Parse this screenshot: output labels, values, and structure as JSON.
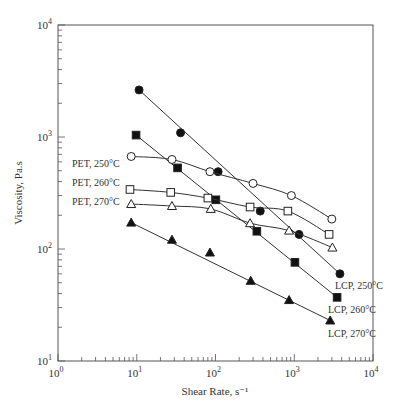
{
  "chart_data": {
    "type": "line",
    "title": "",
    "xlabel": "Shear Rate, s⁻¹",
    "ylabel": "Viscosity, Pa.s",
    "xscale": "log",
    "yscale": "log",
    "xlim": [
      1,
      10000
    ],
    "ylim": [
      10,
      10000
    ],
    "grid": false,
    "x_ticks": [
      {
        "base": "10",
        "exp": "0",
        "value": 1
      },
      {
        "base": "10",
        "exp": "1",
        "value": 10
      },
      {
        "base": "10",
        "exp": "2",
        "value": 100
      },
      {
        "base": "10",
        "exp": "3",
        "value": 1000
      },
      {
        "base": "10",
        "exp": "4",
        "value": 10000
      }
    ],
    "y_ticks": [
      {
        "base": "10",
        "exp": "1",
        "value": 10
      },
      {
        "base": "10",
        "exp": "2",
        "value": 100
      },
      {
        "base": "10",
        "exp": "3",
        "value": 1000
      },
      {
        "base": "10",
        "exp": "4",
        "value": 10000
      }
    ],
    "series": [
      {
        "name": "LCP, 250°C",
        "marker": "filled-circle",
        "x": [
          10.7,
          36,
          108,
          370,
          1150,
          3800
        ],
        "y": [
          2630,
          1090,
          490,
          218,
          135,
          60
        ],
        "label_pos": [
          335,
          289
        ]
      },
      {
        "name": "LCP, 260°C",
        "marker": "filled-square",
        "x": [
          9.8,
          33,
          101,
          335,
          1020,
          3500
        ],
        "y": [
          1040,
          530,
          275,
          144,
          76,
          37
        ],
        "label_pos": [
          328,
          313
        ]
      },
      {
        "name": "LCP, 270°C",
        "marker": "filled-triangle",
        "x": [
          8.5,
          28,
          85,
          280,
          860,
          2860
        ],
        "y": [
          172,
          121,
          93,
          52,
          35,
          23
        ],
        "label_pos": [
          328,
          337
        ]
      },
      {
        "name": "PET, 250°C",
        "marker": "open-circle",
        "x": [
          8.5,
          28,
          85,
          300,
          920,
          3000
        ],
        "y": [
          670,
          630,
          490,
          385,
          300,
          185
        ],
        "label_pos": [
          72,
          167
        ]
      },
      {
        "name": "PET, 260°C",
        "marker": "open-square",
        "x": [
          8.2,
          27,
          80,
          275,
          830,
          2770
        ],
        "y": [
          340,
          320,
          285,
          237,
          218,
          135
        ],
        "label_pos": [
          72,
          186
        ]
      },
      {
        "name": "PET, 270°C",
        "marker": "open-triangle",
        "x": [
          8.5,
          28,
          87,
          275,
          860,
          3050
        ],
        "y": [
          252,
          242,
          228,
          170,
          146,
          103
        ],
        "label_pos": [
          72,
          205
        ]
      }
    ]
  }
}
